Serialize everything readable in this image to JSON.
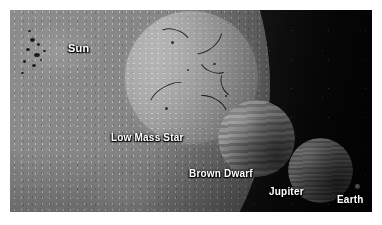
{
  "figure": {
    "background_color": "#0a0a0a",
    "frame_color": "#ffffff"
  },
  "objects": [
    {
      "id": "sun",
      "label": "Sun",
      "icon": "sun-disk-icon",
      "surface": "granular photosphere with sunspot cluster",
      "color": "#8a8a8a"
    },
    {
      "id": "low-mass-star",
      "label": "Low Mass Star",
      "icon": "star-disk-icon",
      "surface": "mottled disk with dark filaments",
      "color": "#b2b2b2"
    },
    {
      "id": "brown-dwarf",
      "label": "Brown Dwarf",
      "icon": "banded-sphere-icon",
      "surface": "horizontal cloud bands",
      "color": "#b4b4b4"
    },
    {
      "id": "jupiter",
      "label": "Jupiter",
      "icon": "banded-sphere-icon",
      "surface": "fine horizontal cloud bands",
      "color": "#b0b0b0"
    },
    {
      "id": "earth",
      "label": "Earth",
      "icon": "small-dot-icon",
      "surface": "tiny bright speck",
      "color": "#c9c9c9"
    }
  ],
  "sunspots": [
    {
      "x": 20,
      "y": 28,
      "w": 5,
      "h": 4
    },
    {
      "x": 27,
      "y": 33,
      "w": 3,
      "h": 3
    },
    {
      "x": 16,
      "y": 38,
      "w": 4,
      "h": 3
    },
    {
      "x": 24,
      "y": 43,
      "w": 6,
      "h": 4
    },
    {
      "x": 33,
      "y": 40,
      "w": 3,
      "h": 2
    },
    {
      "x": 13,
      "y": 50,
      "w": 3,
      "h": 3
    },
    {
      "x": 22,
      "y": 54,
      "w": 4,
      "h": 3
    },
    {
      "x": 30,
      "y": 49,
      "w": 2,
      "h": 2
    },
    {
      "x": 11,
      "y": 62,
      "w": 3,
      "h": 2
    },
    {
      "x": 18,
      "y": 20,
      "w": 3,
      "h": 2
    }
  ],
  "star_filaments": [
    {
      "x": 30,
      "y": 18,
      "w": 34,
      "h": 22,
      "rot": 18
    },
    {
      "x": 58,
      "y": 12,
      "w": 40,
      "h": 26,
      "rot": 140
    },
    {
      "x": 74,
      "y": 40,
      "w": 30,
      "h": 20,
      "rot": 200
    },
    {
      "x": 22,
      "y": 74,
      "w": 44,
      "h": 24,
      "rot": 330
    },
    {
      "x": 66,
      "y": 86,
      "w": 36,
      "h": 22,
      "rot": 30
    },
    {
      "x": 92,
      "y": 62,
      "w": 26,
      "h": 18,
      "rot": 250
    }
  ],
  "star_spots": [
    {
      "x": 46,
      "y": 30,
      "w": 3,
      "h": 3
    },
    {
      "x": 88,
      "y": 52,
      "w": 3,
      "h": 2
    },
    {
      "x": 40,
      "y": 96,
      "w": 3,
      "h": 3
    },
    {
      "x": 100,
      "y": 84,
      "w": 2,
      "h": 2
    },
    {
      "x": 62,
      "y": 58,
      "w": 2,
      "h": 2
    }
  ]
}
